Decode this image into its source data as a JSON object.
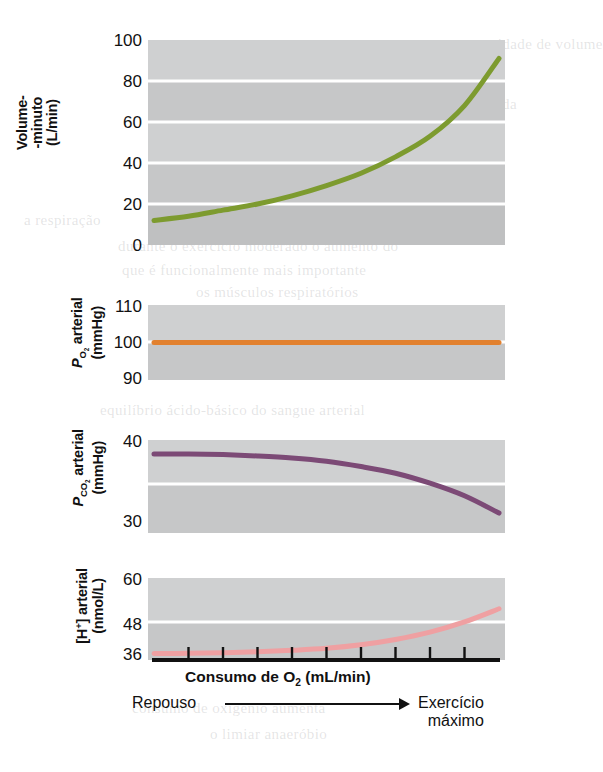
{
  "figure": {
    "x_axis": {
      "title_main": "Consumo de O",
      "title_sub": "2",
      "title_units": " (mL/min)",
      "left_label": "Repouso",
      "right_label_line1": "Exercício",
      "right_label_line2": "máximo",
      "tick_count": 9
    },
    "panels": [
      {
        "id": "volume-minuto",
        "ylabel_line1": "Volume-",
        "ylabel_line2": "-minuto",
        "ylabel_line3": "(L/min)",
        "ticks": [
          "100",
          "80",
          "60",
          "40",
          "20",
          "0"
        ],
        "color": "#7d9b2f"
      },
      {
        "id": "po2-arterial",
        "ylabel_line1": "P",
        "ylabel_sub1": "O2",
        "ylabel_line1b": " arterial",
        "ylabel_line2": "(mmHg)",
        "ticks": [
          "110",
          "100",
          "90"
        ],
        "color": "#e2812f"
      },
      {
        "id": "pco2-arterial",
        "ylabel_line1": "P",
        "ylabel_sub1": "CO2",
        "ylabel_line1b": " arterial",
        "ylabel_line2": "(mmHg)",
        "ticks": [
          "40",
          "30"
        ],
        "color": "#7c4a76"
      },
      {
        "id": "h-arterial",
        "ylabel_line1": "[H",
        "ylabel_sup1": "+",
        "ylabel_line1b": "] arterial",
        "ylabel_line2": "(nmol/L)",
        "ticks": [
          "60",
          "48",
          "36"
        ],
        "color": "#efa0a2"
      }
    ]
  },
  "bleed_text": [
    {
      "t": "uma certa quantidade de volume",
      "x": 396,
      "y": 36
    },
    {
      "t": "distribuída a cada",
      "x": 404,
      "y": 96
    },
    {
      "t": "ventilação",
      "x": 410,
      "y": 140
    },
    {
      "t": "a respiração",
      "x": 24,
      "y": 212
    },
    {
      "t": "durante o exercício moderado o aumento do",
      "x": 118,
      "y": 238
    },
    {
      "t": "que é funcionalmente mais importante",
      "x": 122,
      "y": 262
    },
    {
      "t": "os músculos respiratórios",
      "x": 196,
      "y": 284
    },
    {
      "t": "equilíbrio ácido-básico do sangue arterial",
      "x": 100,
      "y": 402
    },
    {
      "t": "consumo de oxigênio aumenta",
      "x": 132,
      "y": 700
    },
    {
      "t": "o limiar anaeróbio",
      "x": 210,
      "y": 726
    }
  ],
  "chart_data": [
    {
      "type": "line",
      "title": "Volume-minuto (L/min) vs Consumo de O2",
      "ylabel": "Volume-minuto (L/min)",
      "xlabel": "Consumo de O2 (mL/min)",
      "ylim": [
        0,
        100
      ],
      "yticks": [
        0,
        20,
        40,
        60,
        80,
        100
      ],
      "grid": true,
      "legend": "none",
      "series": [
        {
          "name": "Volume-minuto",
          "color": "#7d9b2f",
          "x": [
            0,
            0.1,
            0.2,
            0.3,
            0.4,
            0.5,
            0.6,
            0.7,
            0.8,
            0.9,
            1.0
          ],
          "y": [
            12,
            14,
            17,
            20,
            24,
            29,
            35,
            43,
            53,
            68,
            91
          ]
        }
      ]
    },
    {
      "type": "line",
      "title": "PO2 arterial (mmHg) vs Consumo de O2",
      "ylabel": "PO2 arterial (mmHg)",
      "xlabel": "Consumo de O2 (mL/min)",
      "ylim": [
        90,
        110
      ],
      "yticks": [
        90,
        100,
        110
      ],
      "grid": true,
      "legend": "none",
      "series": [
        {
          "name": "PO2 arterial",
          "color": "#e2812f",
          "x": [
            0,
            0.25,
            0.5,
            0.75,
            1.0
          ],
          "y": [
            100,
            100,
            100,
            100,
            100
          ]
        }
      ]
    },
    {
      "type": "line",
      "title": "PCO2 arterial (mmHg) vs Consumo de O2",
      "ylabel": "PCO2 arterial (mmHg)",
      "xlabel": "Consumo de O2 (mL/min)",
      "ylim": [
        28,
        42
      ],
      "yticks": [
        30,
        40
      ],
      "grid": true,
      "legend": "none",
      "series": [
        {
          "name": "PCO2 arterial",
          "color": "#7c4a76",
          "x": [
            0,
            0.1,
            0.2,
            0.3,
            0.4,
            0.5,
            0.6,
            0.7,
            0.8,
            0.9,
            1.0
          ],
          "y": [
            39.9,
            39.9,
            39.8,
            39.6,
            39.3,
            38.8,
            38.0,
            37.0,
            35.5,
            33.6,
            31.0
          ]
        }
      ]
    },
    {
      "type": "line",
      "title": "[H+] arterial (nmol/L) vs Consumo de O2",
      "ylabel": "[H+] arterial (nmol/L)",
      "xlabel": "Consumo de O2 (mL/min)",
      "ylim": [
        34,
        62
      ],
      "yticks": [
        36,
        48,
        60
      ],
      "grid": true,
      "legend": "none",
      "series": [
        {
          "name": "[H+] arterial",
          "color": "#efa0a2",
          "x": [
            0,
            0.1,
            0.2,
            0.3,
            0.4,
            0.5,
            0.6,
            0.7,
            0.8,
            0.9,
            1.0
          ],
          "y": [
            36.2,
            36.3,
            36.5,
            36.8,
            37.3,
            38.0,
            39.2,
            41.0,
            43.5,
            47.0,
            51.5
          ]
        }
      ]
    }
  ]
}
